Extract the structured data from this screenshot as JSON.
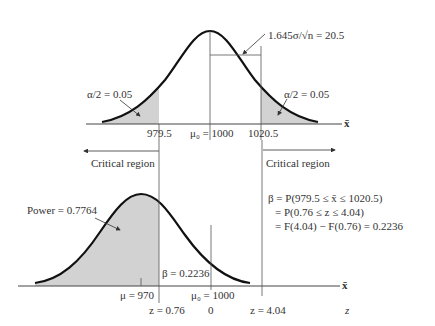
{
  "top_panel": {
    "axis_label": "x̄",
    "left_tail_label": "α/2 = 0.05",
    "right_tail_label": "α/2 = 0.05",
    "bracket_label": "1.645σ/√n = 20.5",
    "ticks": {
      "lower_critical": "979.5",
      "mean": "μ₀ = 1000",
      "upper_critical": "1020.5"
    }
  },
  "critical_regions": {
    "left": "Critical region",
    "right": "Critical region"
  },
  "bottom_panel": {
    "axis_label_x": "x̄",
    "axis_label_z": "z",
    "power_label": "Power = 0.7764",
    "beta_label": "β = 0.2236",
    "ticks": {
      "mu": "μ = 970",
      "mu0": "μ₀ = 1000",
      "z_low": "z = 0.76",
      "z_zero": "0",
      "z_high": "z = 4.04"
    }
  },
  "equations": {
    "line1": "β = P(979.5 ≤ x̄ ≤ 1020.5)",
    "line2": "= P(0.76 ≤ z ≤ 4.04)",
    "line3": "= F(4.04) − F(0.76) = 0.2236"
  },
  "colors": {
    "curve": "#111111",
    "shade": "#d0d0d0",
    "line": "#444444"
  }
}
